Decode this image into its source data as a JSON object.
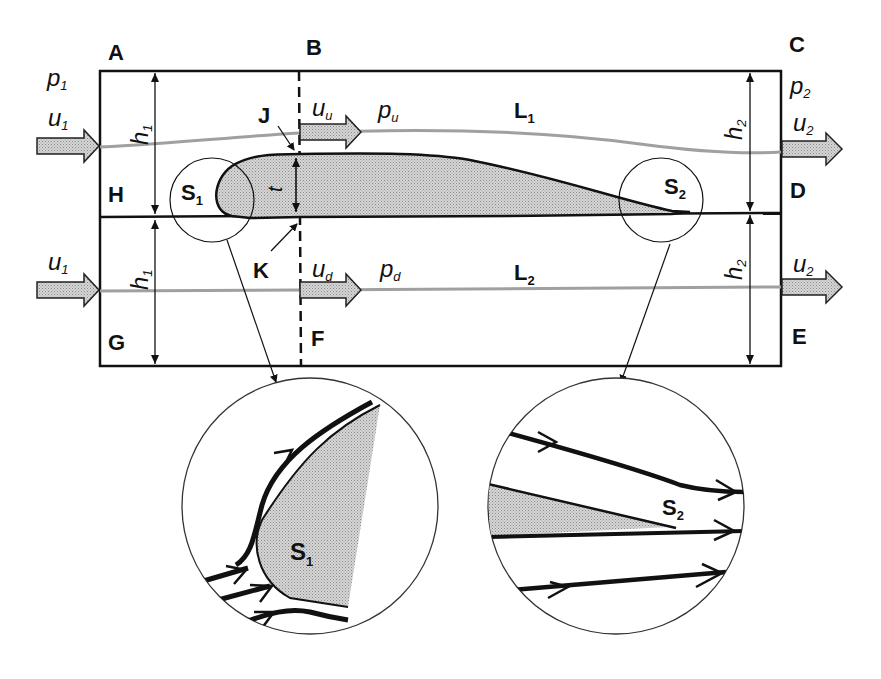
{
  "figure": {
    "type": "control-volume diagram of an airfoil in a channel",
    "corner_labels": {
      "A": "A",
      "B": "B",
      "C": "C",
      "D": "D",
      "E": "E",
      "F": "F",
      "G": "G",
      "H": "H",
      "J": "J",
      "K": "K"
    },
    "inlet": {
      "pressure": "p",
      "pressure_sub": "1",
      "velocity_upper": "u",
      "velocity_upper_sub": "1",
      "velocity_lower": "u",
      "velocity_lower_sub": "1",
      "height_upper": "h",
      "height_upper_sub": "1",
      "height_lower": "h",
      "height_lower_sub": "1"
    },
    "outlet": {
      "pressure": "p",
      "pressure_sub": "2",
      "velocity_upper": "u",
      "velocity_upper_sub": "2",
      "velocity_lower": "u",
      "velocity_lower_sub": "2",
      "height_upper": "h",
      "height_upper_sub": "2",
      "height_lower": "h",
      "height_lower_sub": "2"
    },
    "upper_stream": {
      "velocity": "u",
      "velocity_sub": "u",
      "pressure": "p",
      "pressure_sub": "u",
      "streamline": "L",
      "streamline_sub": "1"
    },
    "lower_stream": {
      "velocity": "d_u",
      "velocity_base": "u",
      "velocity_sub": "d",
      "pressure": "p",
      "pressure_sub": "d",
      "streamline": "L",
      "streamline_sub": "2"
    },
    "thickness_label": "t",
    "stagnation_points": {
      "leading": {
        "base": "S",
        "sub": "1"
      },
      "trailing": {
        "base": "S",
        "sub": "2"
      }
    },
    "detail_views": [
      {
        "name": "leading-edge-detail",
        "label_base": "S",
        "label_sub": "1"
      },
      {
        "name": "trailing-edge-detail",
        "label_base": "S",
        "label_sub": "2"
      }
    ],
    "colors": {
      "stroke": "#111111",
      "fill_gray": "#c8c8c8",
      "streamline_gray": "#a0a0a0"
    }
  }
}
